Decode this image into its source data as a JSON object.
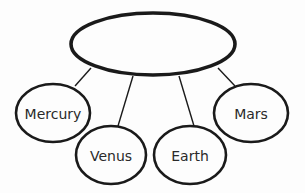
{
  "diagram": {
    "type": "concept-map",
    "colors": {
      "stroke": "#1a1a1a",
      "background": "#fdfdfd",
      "text": "#2a2a2a"
    },
    "root": {
      "label": "",
      "cx": 153,
      "cy": 44,
      "rx": 82,
      "ry": 31
    },
    "nodes": [
      {
        "label": "Mercury",
        "cx": 53,
        "cy": 113,
        "rx": 37,
        "ry": 29,
        "line": [
          91,
          68,
          75,
          86
        ]
      },
      {
        "label": "Venus",
        "cx": 111,
        "cy": 155,
        "rx": 35,
        "ry": 29,
        "line": [
          133,
          76,
          118,
          126
        ]
      },
      {
        "label": "Earth",
        "cx": 190,
        "cy": 155,
        "rx": 36,
        "ry": 29,
        "line": [
          179,
          76,
          194,
          126
        ]
      },
      {
        "label": "Mars",
        "cx": 251,
        "cy": 113,
        "rx": 37,
        "ry": 29,
        "line": [
          218,
          68,
          235,
          86
        ]
      }
    ]
  }
}
